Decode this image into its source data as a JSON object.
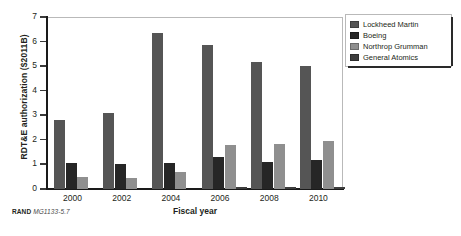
{
  "chart_data": {
    "type": "bar",
    "title": "",
    "xlabel": "Fiscal year",
    "ylabel": "RDT&E authorization ($2011B)",
    "categories": [
      "2000",
      "2002",
      "2004",
      "2006",
      "2008",
      "2010"
    ],
    "ylim": [
      0,
      7
    ],
    "yticks": [
      "0",
      "1",
      "2",
      "3",
      "4",
      "5",
      "6",
      "7"
    ],
    "grid": false,
    "legend_position": "right",
    "series": [
      {
        "name": "Lockheed Martin",
        "color": "#555555",
        "values": [
          2.8,
          3.1,
          6.35,
          5.85,
          5.15,
          5.0
        ]
      },
      {
        "name": "Boeing",
        "color": "#262626",
        "values": [
          1.05,
          1.0,
          1.05,
          1.3,
          1.1,
          1.2
        ]
      },
      {
        "name": "Northrop Grumman",
        "color": "#8f8f8f",
        "values": [
          0.5,
          0.45,
          0.7,
          1.8,
          1.85,
          1.95
        ]
      },
      {
        "name": "General Atomics",
        "color": "#3d3d3d",
        "values": [
          0,
          0,
          0,
          0.07,
          0.1,
          0.1
        ]
      }
    ]
  },
  "legend": {
    "items": [
      {
        "label": "Lockheed Martin"
      },
      {
        "label": "Boeing"
      },
      {
        "label": "Northrop Grumman"
      },
      {
        "label": "General Atomics"
      }
    ]
  },
  "footer": {
    "source": "RAND",
    "figure_number": "MG1133-5.7"
  }
}
